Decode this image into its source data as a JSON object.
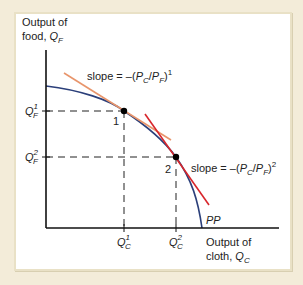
{
  "diagram": {
    "y_axis_label": {
      "line1": "Output of",
      "line2": "food, ",
      "var": "Q",
      "sub": "F"
    },
    "x_axis_label": {
      "line1": "Output of",
      "line2": "cloth, ",
      "var": "Q",
      "sub": "C"
    },
    "curve_label": "PP",
    "points": [
      {
        "label": "1",
        "y_tick": {
          "var": "Q",
          "sub": "F",
          "sup": "1"
        },
        "x_tick": {
          "var": "Q",
          "sub": "C",
          "sup": "1"
        }
      },
      {
        "label": "2",
        "y_tick": {
          "var": "Q",
          "sub": "F",
          "sup": "2"
        },
        "x_tick": {
          "var": "Q",
          "sub": "C",
          "sup": "2"
        }
      }
    ],
    "slope_labels": [
      {
        "prefix": "slope = –(",
        "p1": "P",
        "s1": "C",
        "mid": "/",
        "p2": "P",
        "s2": "F",
        "suffix": ")",
        "sup": "1"
      },
      {
        "prefix": "slope = –(",
        "p1": "P",
        "s1": "C",
        "mid": "/",
        "p2": "P",
        "s2": "F",
        "suffix": ")",
        "sup": "2"
      }
    ],
    "colors": {
      "frontier": "#2b3f7a",
      "tangent_1": "#e8956b",
      "tangent_2": "#d8262c",
      "axes": "#111111",
      "background": "#f3ecd9",
      "panel": "#ffffff"
    }
  }
}
